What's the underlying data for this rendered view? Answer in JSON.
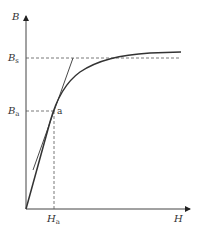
{
  "diagram": {
    "type": "B-H magnetization curve",
    "axes": {
      "y": {
        "label": "B"
      },
      "x": {
        "label": "H"
      }
    },
    "levels": {
      "saturation": {
        "label_main": "B",
        "label_sub": "s"
      },
      "point_level": {
        "label_main": "B",
        "label_sub": "a"
      },
      "point_h": {
        "label_main": "H",
        "label_sub": "a"
      }
    },
    "point": {
      "label": "a"
    },
    "colors": {
      "line": "#333333",
      "dash": "#555555",
      "background": "#ffffff"
    }
  }
}
